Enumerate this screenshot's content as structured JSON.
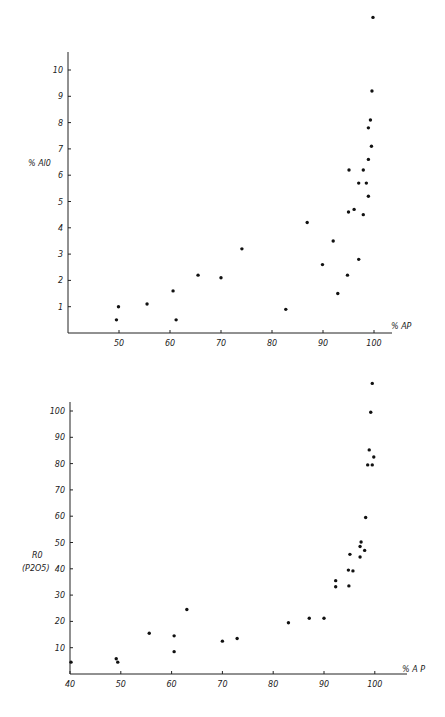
{
  "chart_data": [
    {
      "type": "scatter",
      "title": "",
      "xlabel": "% AP",
      "ylabel": "% Al0",
      "xlim": [
        40,
        105
      ],
      "ylim": [
        0,
        10.5
      ],
      "x_ticks": [
        50,
        60,
        70,
        80,
        90,
        100
      ],
      "x_tick_labels": [
        "50",
        "60",
        "70",
        "80",
        "90",
        "100"
      ],
      "y_ticks": [
        1,
        2,
        3,
        4,
        5,
        6,
        7,
        8,
        9,
        10
      ],
      "y_tick_labels": [
        "1",
        "2",
        "3",
        "4",
        "5",
        "6",
        "7",
        "8",
        "9",
        "10"
      ],
      "grid": false,
      "legend": null,
      "points": [
        {
          "x": 49.5,
          "y": 0.5
        },
        {
          "x": 49.9,
          "y": 1.0
        },
        {
          "x": 55.5,
          "y": 1.1
        },
        {
          "x": 60.6,
          "y": 1.6
        },
        {
          "x": 61.2,
          "y": 0.5
        },
        {
          "x": 65.5,
          "y": 2.2
        },
        {
          "x": 70.0,
          "y": 2.1
        },
        {
          "x": 74.1,
          "y": 3.2
        },
        {
          "x": 82.7,
          "y": 0.9
        },
        {
          "x": 86.9,
          "y": 4.2
        },
        {
          "x": 89.9,
          "y": 2.6
        },
        {
          "x": 92.0,
          "y": 3.5
        },
        {
          "x": 92.9,
          "y": 1.5
        },
        {
          "x": 94.8,
          "y": 2.2
        },
        {
          "x": 95.0,
          "y": 4.6
        },
        {
          "x": 95.1,
          "y": 6.2
        },
        {
          "x": 96.1,
          "y": 4.7
        },
        {
          "x": 97.0,
          "y": 2.8
        },
        {
          "x": 97.0,
          "y": 5.7
        },
        {
          "x": 97.9,
          "y": 6.2
        },
        {
          "x": 97.9,
          "y": 4.5
        },
        {
          "x": 98.5,
          "y": 5.7
        },
        {
          "x": 98.9,
          "y": 6.6
        },
        {
          "x": 98.9,
          "y": 5.2
        },
        {
          "x": 98.9,
          "y": 7.8
        },
        {
          "x": 99.3,
          "y": 8.1
        },
        {
          "x": 99.5,
          "y": 7.1
        },
        {
          "x": 99.6,
          "y": 9.2
        },
        {
          "x": 99.8,
          "y": 12.0
        }
      ]
    },
    {
      "type": "scatter",
      "title": "",
      "xlabel": "% A P",
      "ylabel": "R0 (P2O5)",
      "xlim": [
        40,
        106
      ],
      "ylim": [
        0,
        105
      ],
      "x_ticks": [
        40,
        50,
        60,
        70,
        80,
        90,
        100
      ],
      "x_tick_labels": [
        "40",
        "50",
        "60",
        "70",
        "80",
        "90",
        "100"
      ],
      "y_ticks": [
        10,
        20,
        30,
        40,
        50,
        60,
        70,
        80,
        90,
        100
      ],
      "y_tick_labels": [
        "10",
        "20",
        "30",
        "40",
        "50",
        "60",
        "70",
        "80",
        "90",
        "100"
      ],
      "grid": false,
      "legend": null,
      "points": [
        {
          "x": 40.2,
          "y": 4.5
        },
        {
          "x": 49.1,
          "y": 5.8
        },
        {
          "x": 49.4,
          "y": 4.5
        },
        {
          "x": 55.6,
          "y": 15.5
        },
        {
          "x": 60.5,
          "y": 14.5
        },
        {
          "x": 60.5,
          "y": 8.5
        },
        {
          "x": 63.0,
          "y": 24.5
        },
        {
          "x": 70.0,
          "y": 12.5
        },
        {
          "x": 72.9,
          "y": 13.5
        },
        {
          "x": 83.0,
          "y": 19.5
        },
        {
          "x": 87.1,
          "y": 21.2
        },
        {
          "x": 90.0,
          "y": 21.2
        },
        {
          "x": 92.3,
          "y": 35.5
        },
        {
          "x": 92.3,
          "y": 33.2
        },
        {
          "x": 94.8,
          "y": 39.5
        },
        {
          "x": 94.9,
          "y": 33.5
        },
        {
          "x": 95.1,
          "y": 45.5
        },
        {
          "x": 95.7,
          "y": 39.2
        },
        {
          "x": 97.1,
          "y": 48.5
        },
        {
          "x": 97.1,
          "y": 44.5
        },
        {
          "x": 97.3,
          "y": 50.2
        },
        {
          "x": 98.0,
          "y": 47.0
        },
        {
          "x": 98.2,
          "y": 59.5
        },
        {
          "x": 98.6,
          "y": 79.5
        },
        {
          "x": 98.9,
          "y": 85.2
        },
        {
          "x": 99.2,
          "y": 99.5
        },
        {
          "x": 99.5,
          "y": 79.5
        },
        {
          "x": 99.5,
          "y": 110.5
        },
        {
          "x": 99.8,
          "y": 82.5
        }
      ]
    }
  ],
  "charts": [
    {
      "ylabel_line1": "% Al0",
      "ylabel_line2": "",
      "xlabel": "% AP"
    },
    {
      "ylabel_line1": "R0",
      "ylabel_line2": "(P2O5)",
      "xlabel": "% A P"
    }
  ]
}
